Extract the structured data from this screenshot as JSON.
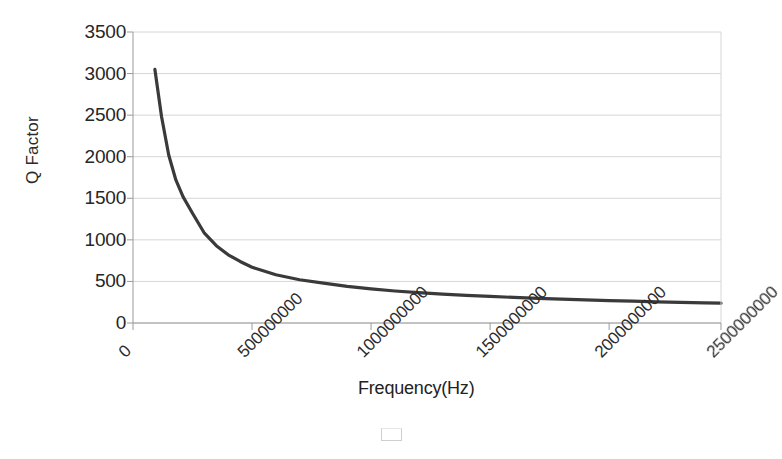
{
  "chart_data": {
    "type": "line",
    "title": "",
    "xlabel": "Frequency(Hz)",
    "ylabel": "Q Factor",
    "xlim": [
      0,
      2470000000
    ],
    "ylim": [
      0,
      3500
    ],
    "grid": true,
    "legend": "none",
    "series": [
      {
        "name": "Q Factor",
        "color": "#3a3a3a",
        "x": [
          92000000,
          120000000,
          150000000,
          180000000,
          210000000,
          250000000,
          300000000,
          350000000,
          400000000,
          450000000,
          500000000,
          600000000,
          700000000,
          800000000,
          900000000,
          1000000000,
          1100000000,
          1200000000,
          1300000000,
          1400000000,
          1500000000,
          1600000000,
          1700000000,
          1800000000,
          1900000000,
          2000000000,
          2100000000,
          2200000000,
          2300000000,
          2400000000,
          2470000000
        ],
        "y": [
          3050,
          2480,
          2020,
          1720,
          1520,
          1320,
          1080,
          930,
          820,
          740,
          670,
          580,
          520,
          480,
          440,
          410,
          385,
          365,
          348,
          333,
          320,
          308,
          297,
          287,
          278,
          270,
          262,
          255,
          248,
          242,
          238
        ]
      }
    ],
    "x_ticks": [
      {
        "value": 0,
        "label": "0"
      },
      {
        "value": 500000000,
        "label": "500000000"
      },
      {
        "value": 1000000000,
        "label": "1000000000"
      },
      {
        "value": 1500000000,
        "label": "1500000000"
      },
      {
        "value": 2000000000,
        "label": "2000000000"
      },
      {
        "value": 2500000000,
        "label": "2500000000"
      }
    ],
    "y_ticks": [
      {
        "value": 0,
        "label": "0"
      },
      {
        "value": 500,
        "label": "500"
      },
      {
        "value": 1000,
        "label": "1000"
      },
      {
        "value": 1500,
        "label": "1500"
      },
      {
        "value": 2000,
        "label": "2000"
      },
      {
        "value": 2500,
        "label": "2500"
      },
      {
        "value": 3000,
        "label": "3000"
      },
      {
        "value": 3500,
        "label": "3500"
      }
    ],
    "colors": {
      "background": "#ffffff",
      "curve": "#3a3a3a",
      "gridline": "#d6d6d6",
      "axis": "#9a9a9a",
      "text": "#262626"
    }
  }
}
